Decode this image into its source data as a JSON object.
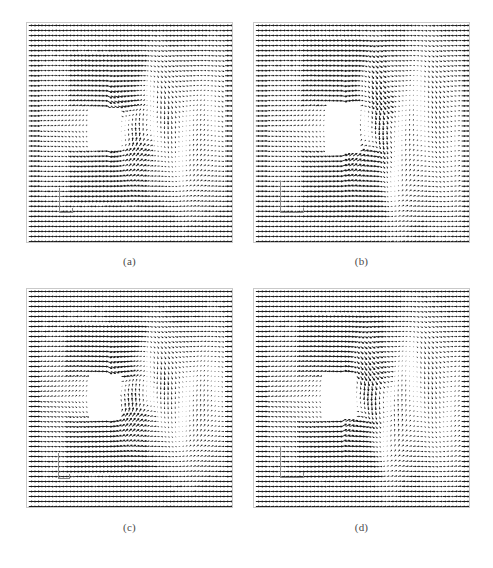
{
  "figure": {
    "type": "vector-field-panels",
    "background_color": "#ffffff",
    "frame_color": "#c9c9c9",
    "arrow_color": "#1a1a1a",
    "caption_color": "#4a4a4a",
    "layout": {
      "rows": 2,
      "cols": 2
    }
  },
  "panels": [
    {
      "id": "panel-a",
      "label": "(a)",
      "rect": {
        "x": 26,
        "y": 22,
        "w": 207,
        "h": 221
      },
      "caption_y": 255,
      "obstacle": {
        "x": 0.305,
        "y": 0.385,
        "w": 0.145,
        "h": 0.185
      },
      "refmark": {
        "x": 0.155,
        "y": 0.745,
        "w": 0.065,
        "h": 0.115
      },
      "flow": {
        "wake_length": 0.62,
        "wake_halfwidth": 0.17,
        "shedding_amplitude": 0.1,
        "shedding_phase": 0.0,
        "shedding_wavelength": 0.3,
        "asymmetry": 0.15,
        "seed": 11
      }
    },
    {
      "id": "panel-b",
      "label": "(b)",
      "rect": {
        "x": 253,
        "y": 22,
        "w": 217,
        "h": 221
      },
      "caption_y": 255,
      "obstacle": {
        "x": 0.325,
        "y": 0.375,
        "w": 0.15,
        "h": 0.215
      },
      "refmark": {
        "x": 0.12,
        "y": 0.715,
        "w": 0.11,
        "h": 0.145
      },
      "flow": {
        "wake_length": 0.55,
        "wake_halfwidth": 0.21,
        "shedding_amplitude": 0.17,
        "shedding_phase": 1.9,
        "shedding_wavelength": 0.26,
        "asymmetry": 0.42,
        "seed": 23
      }
    },
    {
      "id": "panel-c",
      "label": "(c)",
      "rect": {
        "x": 26,
        "y": 288,
        "w": 207,
        "h": 220
      },
      "caption_y": 521,
      "obstacle": {
        "x": 0.3,
        "y": 0.4,
        "w": 0.15,
        "h": 0.18
      },
      "refmark": {
        "x": 0.15,
        "y": 0.745,
        "w": 0.06,
        "h": 0.12
      },
      "flow": {
        "wake_length": 0.7,
        "wake_halfwidth": 0.17,
        "shedding_amplitude": 0.08,
        "shedding_phase": 0.6,
        "shedding_wavelength": 0.33,
        "asymmetry": 0.1,
        "seed": 37
      }
    },
    {
      "id": "panel-d",
      "label": "(d)",
      "rect": {
        "x": 253,
        "y": 288,
        "w": 217,
        "h": 220
      },
      "caption_y": 521,
      "obstacle": {
        "x": 0.315,
        "y": 0.39,
        "w": 0.15,
        "h": 0.2
      },
      "refmark": {
        "x": 0.12,
        "y": 0.715,
        "w": 0.11,
        "h": 0.145
      },
      "flow": {
        "wake_length": 0.6,
        "wake_halfwidth": 0.19,
        "shedding_amplitude": 0.13,
        "shedding_phase": 3.1,
        "shedding_wavelength": 0.28,
        "asymmetry": 0.3,
        "seed": 51
      }
    }
  ],
  "chart_data": {
    "type": "scatter",
    "title": "",
    "subtitle": "",
    "xlabel": "",
    "ylabel": "",
    "grid": false,
    "legend": "none",
    "series": [
      {
        "name": "(a)",
        "arrow_grid": [
          58,
          44
        ],
        "wake_length": 0.62,
        "wake_halfwidth": 0.17,
        "shedding_amplitude": 0.1,
        "asymmetry": 0.15
      },
      {
        "name": "(b)",
        "arrow_grid": [
          58,
          44
        ],
        "wake_length": 0.55,
        "wake_halfwidth": 0.21,
        "shedding_amplitude": 0.17,
        "asymmetry": 0.42
      },
      {
        "name": "(c)",
        "arrow_grid": [
          58,
          44
        ],
        "wake_length": 0.7,
        "wake_halfwidth": 0.17,
        "shedding_amplitude": 0.08,
        "asymmetry": 0.1
      },
      {
        "name": "(d)",
        "arrow_grid": [
          58,
          44
        ],
        "wake_length": 0.6,
        "wake_halfwidth": 0.19,
        "shedding_amplitude": 0.13,
        "asymmetry": 0.3
      }
    ],
    "categories": [
      "(a)",
      "(b)",
      "(c)",
      "(d)"
    ],
    "xlim": [
      0,
      1
    ],
    "ylim": [
      0,
      1
    ]
  }
}
